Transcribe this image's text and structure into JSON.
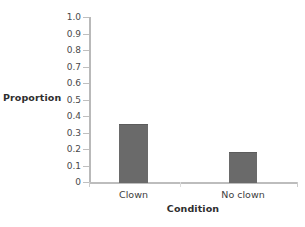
{
  "chart_data": {
    "type": "bar",
    "title": "",
    "subtitle": "",
    "xlabel": "Condition",
    "ylabel": "Proportion",
    "categories": [
      "Clown",
      "No clown"
    ],
    "values": [
      0.35,
      0.18
    ],
    "series": [
      {
        "name": "Proportion",
        "values": [
          0.35,
          0.18
        ]
      }
    ],
    "ylim": [
      0,
      1.0
    ],
    "ytick_labels": [
      "0",
      "0.1",
      "0.2",
      "0.3",
      "0.4",
      "0.5",
      "0.6",
      "0.7",
      "0.8",
      "0.9",
      "1.0"
    ],
    "ytick_values": [
      0,
      0.1,
      0.2,
      0.3,
      0.4,
      0.5,
      0.6,
      0.7,
      0.8,
      0.9,
      1.0
    ],
    "grid": false,
    "legend": "none",
    "bar_color": "#6a6a6a",
    "axis_color": "#bdbdbd",
    "background_color": "#ffffff"
  }
}
